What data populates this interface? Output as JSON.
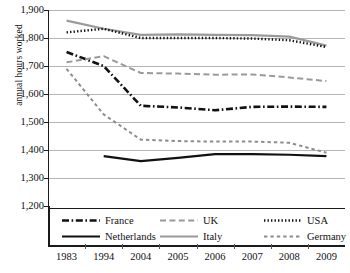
{
  "chart_data": {
    "type": "line",
    "title": "",
    "xlabel": "",
    "ylabel": "annual hours worked",
    "categories": [
      "1983",
      "1994",
      "2004",
      "2005",
      "2006",
      "2007",
      "2008",
      "2009"
    ],
    "ylim": [
      1200,
      1900
    ],
    "yticks": [
      "1,900",
      "1,800",
      "1,700",
      "1,600",
      "1,500",
      "1,400",
      "1,300",
      "1,200"
    ],
    "ytick_values": [
      1900,
      1800,
      1700,
      1600,
      1500,
      1400,
      1300,
      1200
    ],
    "grid": true,
    "legend_position": "below-axis",
    "series": [
      {
        "name": "France",
        "style": "dash-dot",
        "color": "#111111",
        "values": [
          1750,
          1700,
          1558,
          1552,
          1542,
          1554,
          1555,
          1554
        ]
      },
      {
        "name": "Italy",
        "style": "solid",
        "color": "#9a9a9a",
        "values": [
          1862,
          1833,
          1811,
          1813,
          1811,
          1810,
          1805,
          1773
        ]
      },
      {
        "name": "Netherlands",
        "style": "solid",
        "color": "#111111",
        "values": [
          null,
          1378,
          1360,
          1372,
          1385,
          1385,
          1383,
          1378
        ]
      },
      {
        "name": "USA",
        "style": "dotted",
        "color": "#111111",
        "values": [
          1820,
          1833,
          1800,
          1800,
          1800,
          1798,
          1792,
          1768
        ]
      },
      {
        "name": "UK",
        "style": "dashed-long",
        "color": "#9a9a9a",
        "values": [
          1713,
          1735,
          1675,
          1673,
          1669,
          1670,
          1659,
          1646
        ]
      },
      {
        "name": "Germany",
        "style": "dashed-short",
        "color": "#8d8d8d",
        "values": [
          1690,
          1527,
          1437,
          1432,
          1430,
          1430,
          1426,
          1390
        ]
      }
    ]
  },
  "legend": {
    "entries": [
      {
        "label": "France"
      },
      {
        "label": "Netherlands"
      },
      {
        "label": "UK"
      },
      {
        "label": "Italy"
      },
      {
        "label": "USA"
      },
      {
        "label": "Germany"
      }
    ]
  }
}
